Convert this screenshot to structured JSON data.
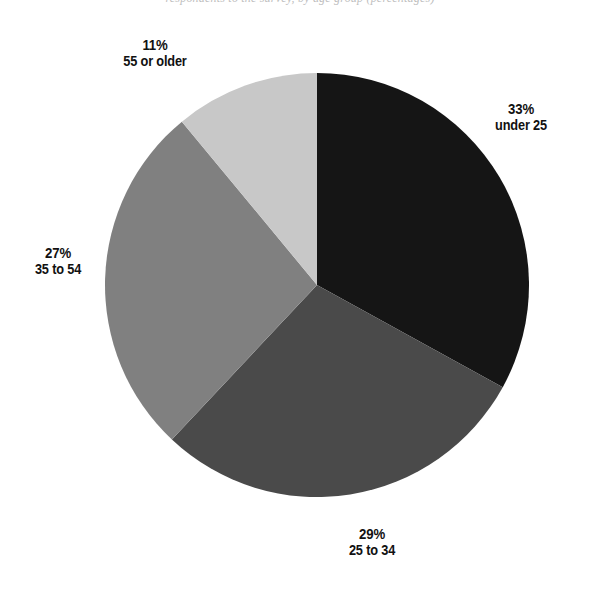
{
  "figure": {
    "caption_remnant": "respondents to the survey, by age group (percentages)",
    "background_color": "#ffffff"
  },
  "chart_data": {
    "type": "pie",
    "title": "",
    "subtitle": "",
    "xlabel": "",
    "ylabel": "",
    "legend_position": "none",
    "grid": false,
    "label_format": "percent-above-category",
    "start_angle_deg": 0,
    "direction": "clockwise",
    "center": {
      "x": 317,
      "y": 285
    },
    "radius": 212,
    "categories": [
      "under 25",
      "25 to 34",
      "35 to 54",
      "55 or older"
    ],
    "values": [
      33,
      29,
      27,
      11
    ],
    "value_labels": [
      "33%",
      "29%",
      "27%",
      "11%"
    ],
    "colors": [
      "#151515",
      "#4a4a4a",
      "#808080",
      "#c8c8c8"
    ],
    "slices": [
      {
        "category": "under 25",
        "value": 33,
        "value_label": "33%",
        "color": "#151515",
        "start_deg": 0,
        "end_deg": 118.8
      },
      {
        "category": "25 to 34",
        "value": 29,
        "value_label": "29%",
        "color": "#4a4a4a",
        "start_deg": 118.8,
        "end_deg": 223.2
      },
      {
        "category": "35 to 54",
        "value": 27,
        "value_label": "27%",
        "color": "#808080",
        "start_deg": 223.2,
        "end_deg": 320.4
      },
      {
        "category": "55 or older",
        "value": 11,
        "value_label": "11%",
        "color": "#c8c8c8",
        "start_deg": 320.4,
        "end_deg": 360
      }
    ]
  },
  "labels": {
    "older": {
      "pct": "11%",
      "cat": "55 or older"
    },
    "under25": {
      "pct": "33%",
      "cat": "under 25"
    },
    "mid": {
      "pct": "27%",
      "cat": "35 to 54"
    },
    "young": {
      "pct": "29%",
      "cat": "25 to 34"
    }
  }
}
